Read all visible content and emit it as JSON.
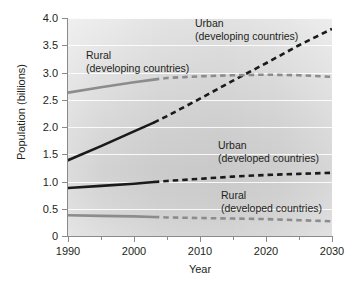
{
  "chart_data": {
    "type": "line",
    "title": "",
    "xlabel": "Year",
    "ylabel": "Population (billions)",
    "xlim": [
      1990,
      2030
    ],
    "ylim": [
      0,
      4.0
    ],
    "grid": true,
    "legend_position": "inline-annotations",
    "xticks": [
      1990,
      2000,
      2010,
      2020,
      2030
    ],
    "xtick_labels": [
      "1990",
      "2000",
      "2010",
      "2020",
      "2030"
    ],
    "xticks_minor": [
      1995,
      2005,
      2015,
      2025
    ],
    "yticks": [
      0,
      0.5,
      1.0,
      1.5,
      2.0,
      2.5,
      3.0,
      3.5,
      4.0
    ],
    "ytick_labels": [
      "0",
      "0.5",
      "1.0",
      "1.5",
      "2.0",
      "2.5",
      "3.0",
      "3.5",
      "4.0"
    ],
    "projection_starts": 2003,
    "note": "Solid segments are historical data (1990-2003); dashed segments are projections (2003-2030).",
    "x": [
      1990,
      1995,
      2000,
      2003,
      2005,
      2010,
      2015,
      2020,
      2025,
      2030
    ],
    "series": [
      {
        "name": "Urban (developing countries)",
        "color": "#1a1a1a",
        "style": "solid-then-dashed",
        "values": [
          1.39,
          1.65,
          1.92,
          2.08,
          2.2,
          2.52,
          2.85,
          3.17,
          3.5,
          3.8
        ]
      },
      {
        "name": "Rural (developing countries)",
        "color": "#8c8c8c",
        "style": "solid-then-dashed",
        "values": [
          2.63,
          2.73,
          2.82,
          2.87,
          2.9,
          2.93,
          2.95,
          2.96,
          2.95,
          2.92
        ]
      },
      {
        "name": "Urban (developed countries)",
        "color": "#1a1a1a",
        "style": "solid-then-dashed",
        "values": [
          0.88,
          0.92,
          0.96,
          0.99,
          1.01,
          1.05,
          1.09,
          1.12,
          1.14,
          1.16
        ]
      },
      {
        "name": "Rural (developed countries)",
        "color": "#8c8c8c",
        "style": "solid-then-dashed",
        "values": [
          0.38,
          0.37,
          0.36,
          0.35,
          0.34,
          0.33,
          0.32,
          0.31,
          0.29,
          0.27
        ]
      }
    ],
    "annotations": [
      {
        "id": "urban-developing",
        "line1": "Urban",
        "line2": "(developing countries)"
      },
      {
        "id": "rural-developing",
        "line1": "Rural",
        "line2": "(developing countries)"
      },
      {
        "id": "urban-developed",
        "line1": "Urban",
        "line2": "(developed countries)"
      },
      {
        "id": "rural-developed",
        "line1": "Rural",
        "line2": "(developed countries)"
      }
    ]
  }
}
